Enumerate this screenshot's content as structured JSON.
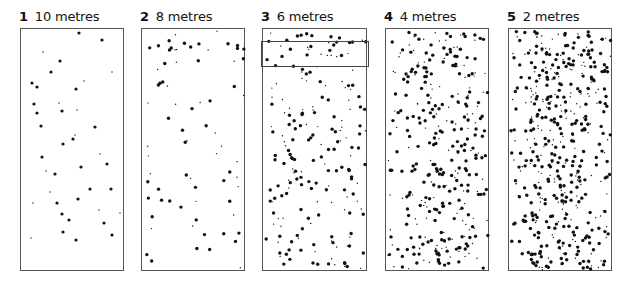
{
  "figure": {
    "panels": [
      {
        "number": "1",
        "label": "10 metres",
        "x": 20,
        "width": 104,
        "density": 45,
        "seed": 11
      },
      {
        "number": "2",
        "label": "8 metres",
        "x": 141,
        "width": 104,
        "density": 75,
        "seed": 23
      },
      {
        "number": "3",
        "label": "6 metres",
        "x": 262,
        "width": 105,
        "density": 200,
        "seed": 37,
        "highlight": {
          "x": 261,
          "y": 41,
          "width": 108,
          "height": 26
        }
      },
      {
        "number": "4",
        "label": "4 metres",
        "x": 385,
        "width": 104,
        "density": 330,
        "seed": 51
      },
      {
        "number": "5",
        "label": "2 metres",
        "x": 508,
        "width": 104,
        "density": 480,
        "seed": 67
      }
    ],
    "panel_top": 28,
    "panel_height": 243,
    "dot_color": "#111111",
    "border_color": "#555555"
  },
  "panel1_dots": [
    [
      64,
      18
    ],
    [
      81,
      23
    ],
    [
      78,
      32
    ],
    [
      101,
      39
    ],
    [
      42,
      51
    ],
    [
      59,
      60
    ],
    [
      50,
      71
    ],
    [
      111,
      71
    ],
    [
      31,
      82
    ],
    [
      36,
      86
    ],
    [
      83,
      80
    ],
    [
      75,
      88
    ],
    [
      33,
      103
    ],
    [
      58,
      102
    ],
    [
      36,
      112
    ],
    [
      61,
      110
    ],
    [
      76,
      109
    ],
    [
      40,
      125
    ],
    [
      94,
      126
    ],
    [
      74,
      134
    ],
    [
      72,
      138
    ],
    [
      62,
      143
    ],
    [
      99,
      153
    ],
    [
      41,
      156
    ],
    [
      106,
      163
    ],
    [
      45,
      170
    ],
    [
      54,
      173
    ],
    [
      80,
      166
    ],
    [
      49,
      191
    ],
    [
      89,
      188
    ],
    [
      110,
      188
    ],
    [
      32,
      202
    ],
    [
      56,
      202
    ],
    [
      77,
      198
    ],
    [
      98,
      209
    ],
    [
      61,
      213
    ],
    [
      68,
      219
    ],
    [
      119,
      212
    ],
    [
      103,
      222
    ],
    [
      62,
      231
    ],
    [
      30,
      237
    ],
    [
      111,
      234
    ],
    [
      75,
      239
    ]
  ]
}
